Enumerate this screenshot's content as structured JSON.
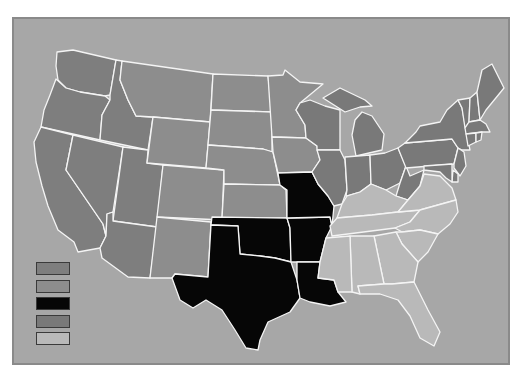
{
  "map": {
    "type": "choropleth",
    "region": "United States (contiguous)",
    "background_color": "#a7a7a7",
    "frame_border_color": "#8a8a8a",
    "state_border_color": "#f4f4f4",
    "categories": {
      "cat1": "#7e7e7e",
      "cat2": "#8d8d8d",
      "cat3": "#060606",
      "cat4": "#797979",
      "cat5": "#b9b9b9"
    },
    "states": {
      "WA": "cat1",
      "OR": "cat1",
      "CA": "cat1",
      "NV": "cat1",
      "ID": "cat1",
      "UT": "cat1",
      "AZ": "cat1",
      "MT": "cat2",
      "WY": "cat2",
      "CO": "cat2",
      "NM": "cat2",
      "ND": "cat2",
      "SD": "cat2",
      "NE": "cat2",
      "KS": "cat2",
      "MN": "cat2",
      "IA": "cat2",
      "TX": "cat3",
      "OK": "cat3",
      "AR": "cat3",
      "LA": "cat3",
      "MO": "cat3",
      "WI": "cat4",
      "MI": "cat4",
      "IL": "cat4",
      "IN": "cat4",
      "OH": "cat4",
      "WV": "cat4",
      "PA": "cat4",
      "NY": "cat4",
      "VT": "cat4",
      "NH": "cat4",
      "ME": "cat4",
      "MA": "cat4",
      "CT": "cat4",
      "RI": "cat4",
      "NJ": "cat4",
      "DE": "cat4",
      "MD": "cat4",
      "KY": "cat5",
      "TN": "cat5",
      "VA": "cat5",
      "NC": "cat5",
      "SC": "cat5",
      "GA": "cat5",
      "AL": "cat5",
      "MS": "cat5",
      "FL": "cat5"
    }
  },
  "legend": {
    "items": [
      {
        "color": "#7e7e7e",
        "label": ""
      },
      {
        "color": "#8d8d8d",
        "label": ""
      },
      {
        "color": "#060606",
        "label": ""
      },
      {
        "color": "#797979",
        "label": ""
      },
      {
        "color": "#b9b9b9",
        "label": ""
      }
    ]
  }
}
